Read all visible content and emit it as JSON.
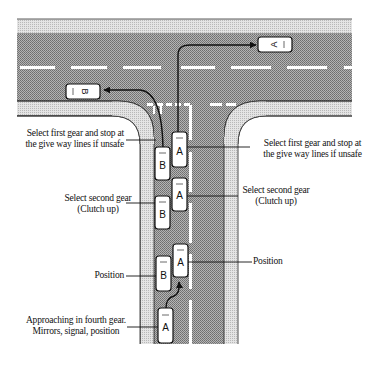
{
  "diagram": {
    "colors": {
      "road": "#9a9a9a",
      "pavement": "#d2d2d2",
      "markings": "#ffffff",
      "car_body": "#ffffff",
      "outline": "#111111"
    },
    "cars": [
      {
        "id": "B",
        "label": "B",
        "position": "turned-left on main road",
        "orientation": "facing-left"
      },
      {
        "id": "A",
        "label": "A",
        "position": "turned-right on main road",
        "orientation": "facing-right"
      },
      {
        "id": "B-stop",
        "label": "B",
        "position": "left lane at give way lines"
      },
      {
        "id": "A-stop",
        "label": "A",
        "position": "right lane at give way lines"
      },
      {
        "id": "B-second",
        "label": "B",
        "position": "left lane, second gear"
      },
      {
        "id": "A-second",
        "label": "A",
        "position": "right lane, second gear"
      },
      {
        "id": "B-position",
        "label": "B",
        "position": "left lane, position"
      },
      {
        "id": "A-position",
        "label": "A",
        "position": "right lane, position"
      },
      {
        "id": "A-approach",
        "label": "A",
        "position": "approaching in fourth gear"
      }
    ],
    "labels": {
      "left_stop_line1": "Select first gear and stop at",
      "left_stop_line2": "the give way lines if unsafe",
      "right_stop_line1": "Select first gear and stop at",
      "right_stop_line2": "the give way lines if unsafe",
      "left_second_line1": "Select second gear",
      "left_second_line2": "(Clutch up)",
      "right_second_line1": "Select second gear",
      "right_second_line2": "(Clutch up)",
      "left_position": "Position",
      "right_position": "Position",
      "approach_line1": "Approaching in fourth gear.",
      "approach_line2": "Mirrors, signal, position"
    },
    "car_letters": {
      "b_main": "B",
      "a_main": "A",
      "b1": "B",
      "a1": "A",
      "b2": "B",
      "a2": "A",
      "b3": "B",
      "a3": "A",
      "a4": "A"
    }
  }
}
